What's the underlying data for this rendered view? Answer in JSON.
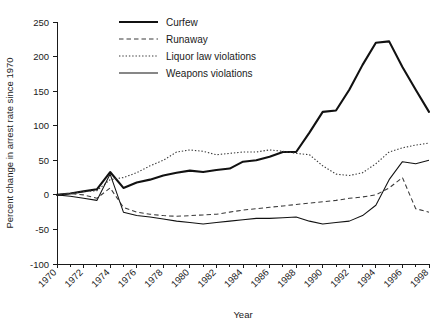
{
  "chart_data": {
    "type": "line",
    "title": "",
    "xlabel": "Year",
    "ylabel": "Percent change in arrest rate since 1970",
    "xlim": [
      1970,
      1998
    ],
    "ylim": [
      -100,
      250
    ],
    "grid": false,
    "legend_position": "top-center",
    "y_ticks": [
      250,
      200,
      150,
      100,
      50,
      0,
      -50,
      -100
    ],
    "y_tick_labels": [
      "250",
      "200",
      "150",
      "100",
      "50",
      "0",
      "-50",
      "-100"
    ],
    "x_ticks": [
      1970,
      1972,
      1974,
      1976,
      1978,
      1980,
      1982,
      1984,
      1986,
      1988,
      1990,
      1992,
      1994,
      1996,
      1998
    ],
    "x_tick_labels": [
      "1970",
      "1972",
      "1974",
      "1976",
      "1978",
      "1980",
      "1982",
      "1984",
      "1986",
      "1988",
      "1990",
      "1992",
      "1994",
      "1996",
      "1998"
    ],
    "x_minor_ticks": [
      1971,
      1973,
      1975,
      1977,
      1979,
      1981,
      1983,
      1985,
      1987,
      1989,
      1991,
      1993,
      1995,
      1997
    ],
    "x": [
      1970,
      1971,
      1972,
      1973,
      1974,
      1975,
      1976,
      1977,
      1978,
      1979,
      1980,
      1981,
      1982,
      1983,
      1984,
      1985,
      1986,
      1987,
      1988,
      1989,
      1990,
      1991,
      1992,
      1993,
      1994,
      1995,
      1996,
      1997,
      1998
    ],
    "series": [
      {
        "name": "Curfew",
        "style": "solid-thick",
        "color": "#111111",
        "values": [
          0,
          2,
          5,
          8,
          33,
          10,
          18,
          22,
          28,
          32,
          35,
          33,
          36,
          38,
          48,
          50,
          55,
          62,
          62,
          90,
          120,
          122,
          152,
          188,
          220,
          222,
          185,
          152,
          120
        ]
      },
      {
        "name": "Runaway",
        "style": "dashed",
        "color": "#3a3a3a",
        "values": [
          0,
          2,
          0,
          -5,
          10,
          -18,
          -25,
          -28,
          -30,
          -31,
          -30,
          -29,
          -28,
          -25,
          -22,
          -20,
          -18,
          -16,
          -14,
          -12,
          -10,
          -8,
          -5,
          -3,
          0,
          10,
          25,
          -20,
          -25
        ]
      },
      {
        "name": "Liquor law violations",
        "style": "dotted",
        "color": "#3a3a3a",
        "values": [
          0,
          2,
          5,
          6,
          22,
          25,
          32,
          42,
          50,
          62,
          65,
          63,
          58,
          60,
          62,
          62,
          65,
          63,
          60,
          58,
          42,
          30,
          28,
          32,
          45,
          62,
          68,
          72,
          75
        ]
      },
      {
        "name": "Weapons violations",
        "style": "solid-thin",
        "color": "#111111",
        "values": [
          0,
          -2,
          -5,
          -8,
          30,
          -25,
          -30,
          -32,
          -35,
          -38,
          -40,
          -42,
          -40,
          -38,
          -36,
          -34,
          -34,
          -33,
          -32,
          -38,
          -42,
          -40,
          -38,
          -30,
          -15,
          22,
          48,
          45,
          50
        ]
      }
    ]
  },
  "legend": {
    "items": [
      {
        "label": "Curfew",
        "key": "curfew"
      },
      {
        "label": "Runaway",
        "key": "runaway"
      },
      {
        "label": "Liquor law violations",
        "key": "liquor"
      },
      {
        "label": "Weapons violations",
        "key": "weapons"
      }
    ]
  }
}
